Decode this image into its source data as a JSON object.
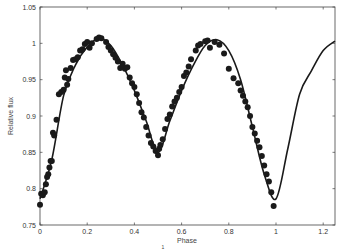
{
  "chart_data": {
    "type": "scatter",
    "title": "",
    "xlabel": "Phase",
    "ylabel": "Relative flux",
    "xlim": [
      0,
      1.25
    ],
    "ylim": [
      0.75,
      1.05
    ],
    "xticks": [
      0,
      0.2,
      0.4,
      0.6,
      0.8,
      1,
      1.2
    ],
    "xtick_labels": [
      "0",
      "0.2",
      "0.4",
      "0.6",
      "0.8",
      "1",
      "1.2"
    ],
    "yticks": [
      0.75,
      0.8,
      0.85,
      0.9,
      0.95,
      1,
      1.05
    ],
    "ytick_labels": [
      "0.75",
      "0.8",
      "0.85",
      "0.9",
      "0.95",
      "1",
      "1.05"
    ],
    "grid": false,
    "footnote": "1",
    "series": [
      {
        "name": "Observed",
        "kind": "markers",
        "color": "#1a1a1a",
        "x": [
          0.0,
          0.005,
          0.012,
          0.02,
          0.025,
          0.03,
          0.035,
          0.04,
          0.045,
          0.05,
          0.055,
          0.06,
          0.07,
          0.08,
          0.09,
          0.1,
          0.105,
          0.11,
          0.115,
          0.12,
          0.13,
          0.14,
          0.15,
          0.16,
          0.17,
          0.18,
          0.19,
          0.2,
          0.21,
          0.22,
          0.24,
          0.25,
          0.26,
          0.28,
          0.29,
          0.3,
          0.31,
          0.32,
          0.33,
          0.34,
          0.35,
          0.36,
          0.37,
          0.38,
          0.39,
          0.4,
          0.41,
          0.42,
          0.43,
          0.44,
          0.45,
          0.46,
          0.47,
          0.48,
          0.49,
          0.5,
          0.505,
          0.51,
          0.52,
          0.53,
          0.54,
          0.55,
          0.56,
          0.57,
          0.58,
          0.59,
          0.6,
          0.61,
          0.62,
          0.63,
          0.64,
          0.66,
          0.67,
          0.68,
          0.7,
          0.71,
          0.72,
          0.74,
          0.76,
          0.78,
          0.8,
          0.82,
          0.84,
          0.85,
          0.86,
          0.87,
          0.88,
          0.89,
          0.9,
          0.91,
          0.92,
          0.93,
          0.94,
          0.95,
          0.96,
          0.97,
          0.98,
          0.99
        ],
        "y": [
          0.778,
          0.793,
          0.791,
          0.795,
          0.806,
          0.816,
          0.82,
          0.829,
          0.838,
          0.838,
          0.877,
          0.873,
          0.895,
          0.93,
          0.933,
          0.936,
          0.953,
          0.963,
          0.943,
          0.951,
          0.966,
          0.977,
          0.978,
          0.981,
          0.99,
          0.992,
          0.999,
          1.002,
          0.994,
          1.0,
          1.006,
          1.008,
          1.007,
          1.002,
          0.995,
          0.99,
          0.985,
          0.98,
          0.975,
          0.966,
          0.972,
          0.965,
          0.967,
          0.953,
          0.945,
          0.94,
          0.93,
          0.918,
          0.905,
          0.898,
          0.885,
          0.873,
          0.863,
          0.858,
          0.852,
          0.846,
          0.855,
          0.86,
          0.868,
          0.882,
          0.896,
          0.902,
          0.913,
          0.92,
          0.925,
          0.933,
          0.94,
          0.955,
          0.96,
          0.968,
          0.978,
          0.99,
          0.997,
          0.999,
          1.003,
          1.004,
          0.994,
          1.002,
          0.998,
          0.986,
          0.965,
          0.952,
          0.945,
          0.935,
          0.928,
          0.92,
          0.912,
          0.9,
          0.885,
          0.876,
          0.866,
          0.857,
          0.845,
          0.832,
          0.82,
          0.81,
          0.795,
          0.776
        ]
      },
      {
        "name": "Model",
        "kind": "line",
        "color": "#1a1a1a",
        "x": [
          0.0,
          0.05,
          0.1,
          0.15,
          0.2,
          0.25,
          0.3,
          0.35,
          0.4,
          0.45,
          0.5,
          0.55,
          0.6,
          0.65,
          0.7,
          0.75,
          0.8,
          0.85,
          0.9,
          0.95,
          1.0,
          1.05,
          1.1,
          1.15,
          1.2,
          1.25
        ],
        "y": [
          0.786,
          0.84,
          0.928,
          0.97,
          0.995,
          1.007,
          0.997,
          0.97,
          0.935,
          0.893,
          0.85,
          0.893,
          0.935,
          0.97,
          0.997,
          1.005,
          0.99,
          0.95,
          0.885,
          0.82,
          0.786,
          0.855,
          0.93,
          0.962,
          0.99,
          1.003
        ]
      }
    ]
  }
}
